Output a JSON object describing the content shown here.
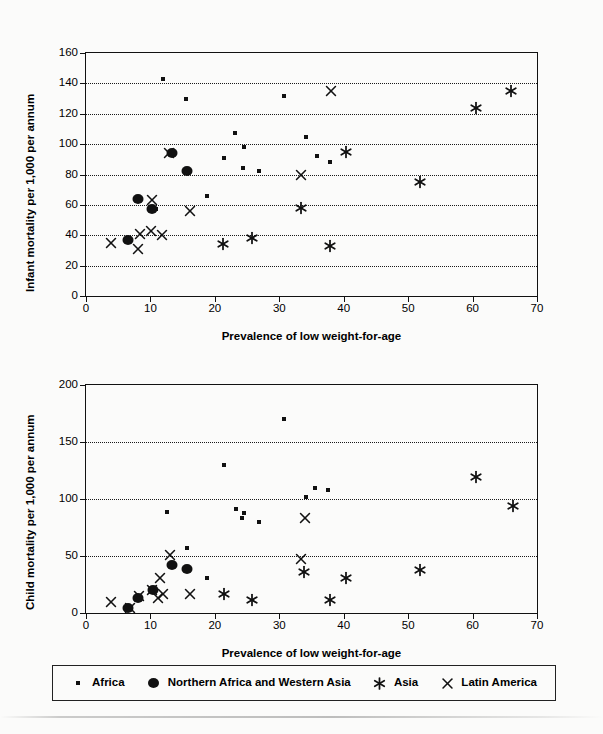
{
  "legend": {
    "entries": [
      {
        "label": "Africa",
        "marker": "small-square-icon",
        "color": "#111111"
      },
      {
        "label": "Northern Africa and Western Asia",
        "marker": "filled-circle-icon",
        "color": "#111111"
      },
      {
        "label": "Asia",
        "marker": "asterisk-icon",
        "color": "#111111"
      },
      {
        "label": "Latin America",
        "marker": "cross-x-icon",
        "color": "#111111"
      }
    ]
  },
  "chart_data": [
    {
      "type": "scatter",
      "title": "",
      "xlabel": "Prevalence of low weight-for-age",
      "ylabel": "Infant mortality per 1,000 per annum",
      "xlim": [
        0,
        70
      ],
      "ylim": [
        0,
        160
      ],
      "xticks": [
        0,
        10,
        20,
        30,
        40,
        50,
        60,
        70
      ],
      "yticks": [
        0,
        20,
        40,
        60,
        80,
        100,
        120,
        140,
        160
      ],
      "grid": "horizontal-dotted",
      "legend_position": "below-figure",
      "series": [
        {
          "name": "Africa",
          "marker": "small-square-icon",
          "points": [
            [
              12.0,
              143
            ],
            [
              15.5,
              130
            ],
            [
              30.8,
              132
            ],
            [
              23.2,
              107
            ],
            [
              24.6,
              98
            ],
            [
              34.2,
              105
            ],
            [
              21.4,
              91
            ],
            [
              35.8,
              92
            ],
            [
              37.8,
              88
            ],
            [
              24.4,
              84
            ],
            [
              26.8,
              82
            ],
            [
              10.9,
              57
            ],
            [
              18.8,
              66
            ]
          ]
        },
        {
          "name": "Northern Africa and Western Asia",
          "marker": "filled-circle-icon",
          "points": [
            [
              13.3,
              94
            ],
            [
              15.6,
              82
            ],
            [
              8.0,
              64
            ],
            [
              10.2,
              57
            ],
            [
              6.5,
              37
            ]
          ]
        },
        {
          "name": "Asia",
          "marker": "asterisk-icon",
          "points": [
            [
              66.0,
              135
            ],
            [
              60.6,
              124
            ],
            [
              40.3,
              95
            ],
            [
              51.9,
              75
            ],
            [
              33.3,
              58
            ],
            [
              25.8,
              38
            ],
            [
              21.3,
              34
            ],
            [
              37.9,
              33
            ]
          ]
        },
        {
          "name": "Latin America",
          "marker": "cross-x-icon",
          "points": [
            [
              38.0,
              135
            ],
            [
              12.9,
              94
            ],
            [
              33.4,
              80
            ],
            [
              10.3,
              63
            ],
            [
              16.2,
              56
            ],
            [
              10.1,
              43
            ],
            [
              11.8,
              40
            ],
            [
              8.4,
              41
            ],
            [
              3.9,
              35
            ],
            [
              8.0,
              31
            ]
          ]
        }
      ]
    },
    {
      "type": "scatter",
      "title": "",
      "xlabel": "Prevalence of low weight-for-age",
      "ylabel": "Child mortality per 1,000 per annum",
      "xlim": [
        0,
        70
      ],
      "ylim": [
        0,
        200
      ],
      "xticks": [
        0,
        10,
        20,
        30,
        40,
        50,
        60,
        70
      ],
      "yticks": [
        0,
        50,
        100,
        150,
        200
      ],
      "grid": "horizontal-dotted",
      "legend_position": "below-figure",
      "series": [
        {
          "name": "Africa",
          "marker": "small-square-icon",
          "points": [
            [
              30.8,
              170
            ],
            [
              21.4,
              130
            ],
            [
              35.5,
              110
            ],
            [
              37.6,
              108
            ],
            [
              34.1,
              102
            ],
            [
              12.5,
              89
            ],
            [
              23.3,
              91
            ],
            [
              24.5,
              88
            ],
            [
              24.2,
              83
            ],
            [
              26.8,
              80
            ],
            [
              15.7,
              57
            ],
            [
              18.8,
              31
            ]
          ]
        },
        {
          "name": "Northern Africa and Western Asia",
          "marker": "filled-circle-icon",
          "points": [
            [
              13.4,
              42
            ],
            [
              15.6,
              39
            ],
            [
              10.4,
              20
            ],
            [
              8.0,
              13
            ],
            [
              6.5,
              4
            ]
          ]
        },
        {
          "name": "Asia",
          "marker": "asterisk-icon",
          "points": [
            [
              60.6,
              119
            ],
            [
              66.3,
              94
            ],
            [
              51.9,
              38
            ],
            [
              40.3,
              31
            ],
            [
              33.8,
              36
            ],
            [
              21.4,
              17
            ],
            [
              25.8,
              11
            ],
            [
              37.8,
              11
            ]
          ]
        },
        {
          "name": "Latin America",
          "marker": "cross-x-icon",
          "points": [
            [
              34.0,
              83
            ],
            [
              13.0,
              51
            ],
            [
              33.4,
              47
            ],
            [
              11.5,
              31
            ],
            [
              10.3,
              20
            ],
            [
              11.9,
              17
            ],
            [
              16.2,
              17
            ],
            [
              8.2,
              15
            ],
            [
              11.2,
              13
            ],
            [
              3.9,
              10
            ],
            [
              6.8,
              4
            ]
          ]
        }
      ]
    }
  ]
}
